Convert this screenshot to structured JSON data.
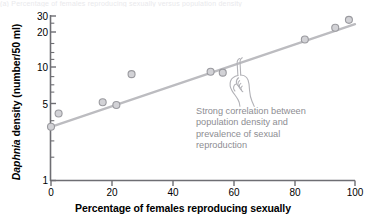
{
  "figure": {
    "top_sliver_text": "(a)  Percentage of females reproducing sexually versus population density",
    "background_color": "#ffffff"
  },
  "annotation": {
    "name": "correlation-callout",
    "text": "Strong correlation between\npopulation density and\nprevalence of sexual\nreproduction",
    "color": "#8d8d92",
    "pointer_icon": "pointing-hand-icon"
  },
  "chart_data": {
    "type": "scatter",
    "title": "",
    "subtitle": "",
    "xlabel": "Percentage of females reproducing sexually",
    "ylabel": "Daphnia density (number/50 ml)",
    "ylabel_italic_part": "Daphnia",
    "ylabel_rest": " density (number/50 ml)",
    "xlim": [
      0,
      100
    ],
    "ylim": [
      1,
      32
    ],
    "yscale": "log",
    "xscale": "linear",
    "grid": false,
    "legend": "none",
    "xticks": [
      0,
      20,
      40,
      60,
      80,
      100
    ],
    "xtick_labels": [
      "0",
      "20",
      "40",
      "60",
      "80",
      "100"
    ],
    "yticks": [
      1,
      5,
      10,
      20,
      30
    ],
    "ytick_labels": [
      "1",
      "5",
      "10",
      "20",
      "30"
    ],
    "yminor_ticks": [
      2,
      3,
      4,
      6,
      7,
      8,
      9,
      15,
      25
    ],
    "marker_fill": "#d2d2d6",
    "marker_edge": "#9a9a9f",
    "line_color": "#bcbcc0",
    "axis_color": "#6e6e73",
    "points": [
      {
        "x": 0.0,
        "y": 3.1
      },
      {
        "x": 2.5,
        "y": 4.1
      },
      {
        "x": 17.0,
        "y": 5.2
      },
      {
        "x": 21.5,
        "y": 4.9
      },
      {
        "x": 26.5,
        "y": 9.4
      },
      {
        "x": 52.5,
        "y": 9.9
      },
      {
        "x": 56.5,
        "y": 9.7
      },
      {
        "x": 83.5,
        "y": 19.5
      },
      {
        "x": 93.5,
        "y": 25.0
      },
      {
        "x": 98.0,
        "y": 29.5
      }
    ],
    "series": [
      {
        "name": "Daphnia density",
        "x": [
          0.0,
          2.5,
          17.0,
          21.5,
          26.5,
          52.5,
          56.5,
          83.5,
          93.5,
          98.0
        ],
        "values": [
          3.1,
          4.1,
          5.2,
          4.9,
          9.4,
          9.9,
          9.7,
          19.5,
          25.0,
          29.5
        ]
      }
    ],
    "trendline": {
      "name": "fitted-regression-line",
      "x_start": 0,
      "y_start": 3.1,
      "x_end": 100,
      "y_end": 27.0
    },
    "annotations": [
      {
        "text": "Strong correlation between population density and prevalence of sexual reproduction",
        "x": 62,
        "y": 3.0
      }
    ]
  }
}
